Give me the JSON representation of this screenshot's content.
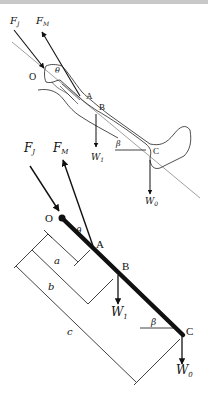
{
  "figure": {
    "top_panel": {
      "description": "Sketch of a leg with free-body force annotations",
      "labels": {
        "force_joint": "F",
        "force_joint_sub": "J",
        "force_muscle": "F",
        "force_muscle_sub": "M",
        "point_o": "O",
        "angle_theta": "θ",
        "point_a": "A",
        "point_b": "B",
        "weight_leg": "W",
        "weight_leg_sub": "1",
        "angle_beta": "β",
        "point_c": "C",
        "weight_foot": "W",
        "weight_foot_sub": "0"
      }
    },
    "bottom_panel": {
      "description": "Simplified free-body diagram as a rigid bar",
      "labels": {
        "force_joint": "F",
        "force_joint_sub": "J",
        "force_muscle": "F",
        "force_muscle_sub": "M",
        "point_o": "O",
        "angle_theta": "θ",
        "point_a": "A",
        "point_b": "B",
        "weight_leg": "W",
        "weight_leg_sub": "1",
        "angle_beta": "β",
        "point_c": "C",
        "weight_foot": "W",
        "weight_foot_sub": "0",
        "dim_a": "a",
        "dim_b": "b",
        "dim_c": "c"
      }
    }
  }
}
